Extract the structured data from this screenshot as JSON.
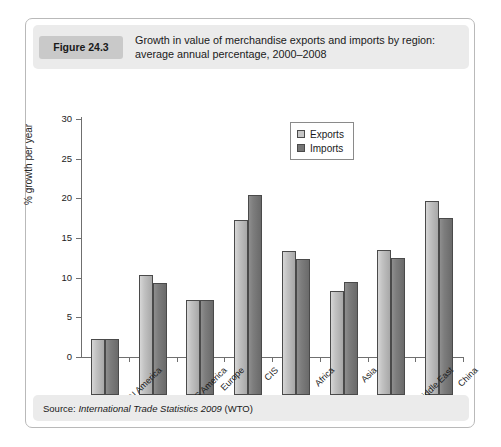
{
  "figure": {
    "badge": "Figure 24.3",
    "caption": "Growth in value of merchandise exports and imports by region: average annual percentage, 2000–2008",
    "source_prefix": "Source:",
    "source_title": "International Trade Statistics 2009",
    "source_suffix": "(WTO)"
  },
  "chart_data": {
    "type": "bar",
    "title": "Growth in value of merchandise exports and imports by region: average annual percentage, 2000–2008",
    "xlabel": "",
    "ylabel": "% growth per year",
    "ylim": [
      0,
      30
    ],
    "yticks": [
      0,
      5,
      10,
      15,
      20,
      25,
      30
    ],
    "ytick_labels": [
      "0",
      "5",
      "10",
      "15",
      "20",
      "25",
      "30"
    ],
    "grid": false,
    "legend_position": "top-right",
    "categories": [
      "N America",
      "C & S America",
      "Europe",
      "CIS",
      "Africa",
      "Asia",
      "Middle East",
      "China"
    ],
    "series": [
      {
        "name": "Exports",
        "color": "#c2c2c2",
        "values": [
          7.0,
          15.1,
          12.0,
          22.0,
          18.1,
          13.1,
          18.3,
          24.5
        ]
      },
      {
        "name": "Imports",
        "color": "#7d7d7d",
        "values": [
          7.0,
          14.1,
          12.0,
          25.2,
          17.2,
          14.3,
          17.3,
          22.3
        ]
      }
    ]
  }
}
